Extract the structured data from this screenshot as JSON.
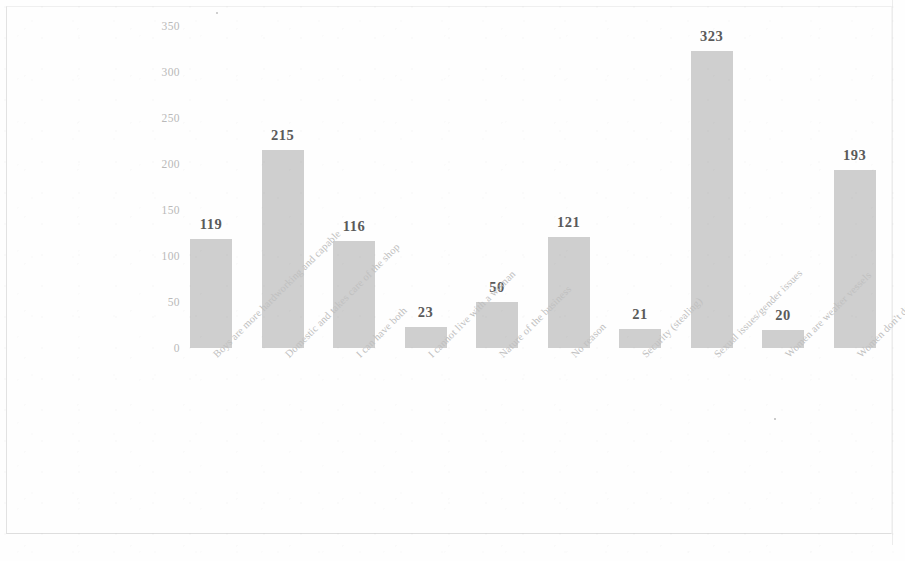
{
  "chart_data": {
    "type": "bar",
    "title": "",
    "subtitle": "",
    "xlabel": "",
    "ylabel": "",
    "ylim": [
      0,
      350
    ],
    "yticks": [
      0,
      50,
      100,
      150,
      200,
      250,
      300,
      350
    ],
    "grid": false,
    "legend": null,
    "data_labels": true,
    "bar_color": "#cfcfcf",
    "categories": [
      "Boys are more hardworking and capable",
      "Domestic and takes care of the shop",
      "I can have both",
      "I cannot live with a woman",
      "Nature of the business",
      "No reason",
      "Security (stealing)",
      "Sexual issues/gender issues",
      "Women are weaker vessels",
      "Women don't do nwa boys"
    ],
    "values": [
      119,
      215,
      116,
      23,
      50,
      121,
      21,
      323,
      20,
      193
    ]
  },
  "axis": {
    "tick_350": "350",
    "tick_300": "300",
    "tick_250": "250",
    "tick_200": "200",
    "tick_150": "150",
    "tick_100": "100",
    "tick_50": "50",
    "tick_0": "0"
  }
}
